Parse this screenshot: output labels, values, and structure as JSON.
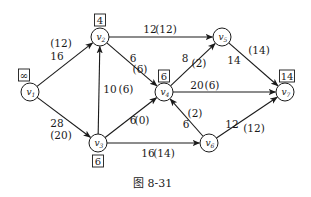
{
  "caption": "图 8-31",
  "nodes": [
    {
      "id": "v1",
      "base": "v",
      "sub": "1",
      "x": 30,
      "y": 92,
      "mark": "∞",
      "mark_x": 24,
      "mark_y": 75
    },
    {
      "id": "v2",
      "base": "v",
      "sub": "2",
      "x": 100,
      "y": 37,
      "mark": "4",
      "mark_x": 100,
      "mark_y": 20
    },
    {
      "id": "v3",
      "base": "v",
      "sub": "3",
      "x": 98,
      "y": 143,
      "mark": "6",
      "mark_x": 98,
      "mark_y": 161
    },
    {
      "id": "v4",
      "base": "v",
      "sub": "4",
      "x": 164,
      "y": 92,
      "mark": "6",
      "mark_x": 164,
      "mark_y": 76
    },
    {
      "id": "v5",
      "base": "v",
      "sub": "5",
      "x": 222,
      "y": 37,
      "mark": null
    },
    {
      "id": "v6",
      "base": "v",
      "sub": "6",
      "x": 209,
      "y": 143,
      "mark": null
    },
    {
      "id": "v7",
      "base": "v",
      "sub": "7",
      "x": 285,
      "y": 92,
      "mark": "14",
      "mark_x": 287,
      "mark_y": 76
    }
  ],
  "edges": [
    {
      "from": "v1",
      "to": "v2",
      "capacity": "16",
      "flow": "(12)",
      "cap_pos": [
        57,
        60
      ],
      "flow_pos": [
        61,
        47
      ]
    },
    {
      "from": "v1",
      "to": "v3",
      "capacity": "28",
      "flow": "(20)",
      "cap_pos": [
        57,
        127
      ],
      "flow_pos": [
        61,
        139
      ]
    },
    {
      "from": "v3",
      "to": "v2",
      "capacity": "10",
      "flow": "(6)",
      "cap_pos": [
        110,
        93
      ],
      "flow_pos": [
        126,
        93
      ]
    },
    {
      "from": "v2",
      "to": "v5",
      "capacity": "12",
      "flow": "(12)",
      "cap_pos": [
        150,
        33
      ],
      "flow_pos": [
        166,
        33
      ]
    },
    {
      "from": "v2",
      "to": "v4",
      "capacity": "6",
      "flow": "(6)",
      "cap_pos": [
        133,
        62
      ],
      "flow_pos": [
        140,
        73
      ]
    },
    {
      "from": "v3",
      "to": "v4",
      "capacity": "6",
      "flow": "(0)",
      "cap_pos": [
        133,
        124
      ],
      "flow_pos": [
        142,
        124
      ]
    },
    {
      "from": "v3",
      "to": "v6",
      "capacity": "16",
      "flow": "(14)",
      "cap_pos": [
        148,
        157
      ],
      "flow_pos": [
        164,
        157
      ]
    },
    {
      "from": "v4",
      "to": "v5",
      "capacity": "8",
      "flow": "(2)",
      "cap_pos": [
        185,
        62
      ],
      "flow_pos": [
        199,
        67
      ]
    },
    {
      "from": "v4",
      "to": "v7",
      "capacity": "20",
      "flow": "(6)",
      "cap_pos": [
        197,
        89
      ],
      "flow_pos": [
        212,
        89
      ]
    },
    {
      "from": "v6",
      "to": "v4",
      "capacity": "6",
      "flow": "(2)",
      "cap_pos": [
        186,
        128
      ],
      "flow_pos": [
        195,
        117
      ]
    },
    {
      "from": "v5",
      "to": "v7",
      "capacity": "14",
      "flow": "(14)",
      "cap_pos": [
        234,
        64
      ],
      "flow_pos": [
        259,
        54
      ]
    },
    {
      "from": "v6",
      "to": "v7",
      "capacity": "12",
      "flow": "(12)",
      "cap_pos": [
        232,
        128
      ],
      "flow_pos": [
        254,
        132
      ]
    }
  ]
}
